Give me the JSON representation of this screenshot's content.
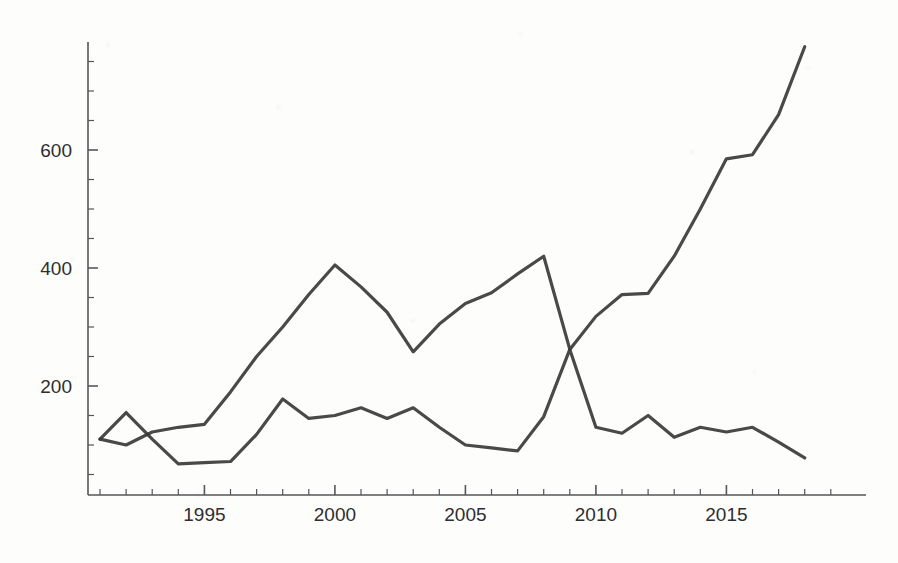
{
  "chart_data": {
    "type": "line",
    "title": "",
    "subtitle": "",
    "xlabel": "",
    "ylabel": "",
    "xlim": [
      1991,
      2018
    ],
    "ylim": [
      0,
      790
    ],
    "grid": false,
    "legend": false,
    "legend_position": "none",
    "x_tick_labels": [
      "1995",
      "2000",
      "2005",
      "2010",
      "2015"
    ],
    "x_ticks": [
      1995,
      2000,
      2005,
      2010,
      2015
    ],
    "x_minor_tick_step": 1,
    "y_tick_labels": [
      "200",
      "400",
      "600"
    ],
    "y_ticks": [
      200,
      400,
      600
    ],
    "y_minor_tick_step": 50,
    "line_color": "#3a3a3a",
    "axis_color": "#55565a",
    "background_color": "#fdfdfc",
    "x": [
      1991,
      1992,
      1993,
      1994,
      1995,
      1996,
      1997,
      1998,
      1999,
      2000,
      2001,
      2002,
      2003,
      2004,
      2005,
      2006,
      2007,
      2008,
      2009,
      2010,
      2011,
      2012,
      2013,
      2014,
      2015,
      2016,
      2017,
      2018
    ],
    "series": [
      {
        "name": "series-rising",
        "values": [
          110,
          100,
          122,
          130,
          135,
          190,
          250,
          300,
          355,
          405,
          368,
          325,
          258,
          305,
          340,
          358,
          390,
          420,
          262,
          318,
          355,
          357,
          420,
          500,
          585,
          592,
          660,
          775
        ]
      },
      {
        "name": "series-declining",
        "values": [
          110,
          155,
          110,
          68,
          70,
          72,
          118,
          178,
          145,
          150,
          163,
          145,
          163,
          130,
          100,
          95,
          90,
          148,
          262,
          130,
          120,
          150,
          113,
          130,
          122,
          130,
          105,
          78
        ]
      }
    ],
    "annotations": [
      {
        "label": "crossover",
        "x": 2009,
        "y": 262
      }
    ]
  },
  "axes": {
    "y_axis_name": "y-axis",
    "x_axis_name": "x-axis"
  }
}
